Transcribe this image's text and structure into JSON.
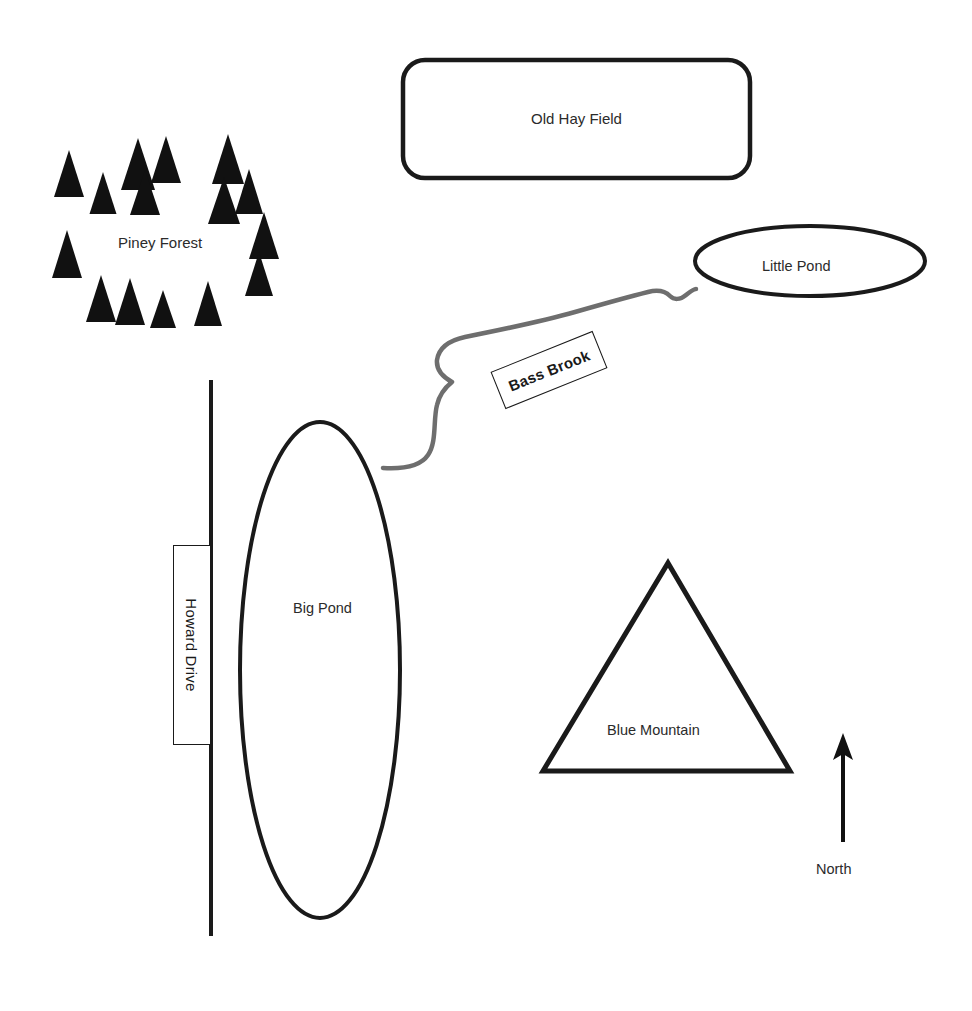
{
  "map": {
    "title": "Nature Area Sketch Map",
    "background_color": "#ffffff",
    "ink_color": "#1a1a1a",
    "text_color": "#2b2b2b",
    "brook_color": "#6e6e6e",
    "features": {
      "old_hay_field": {
        "label": "Old Hay Field",
        "shape": "rounded-rectangle",
        "x": 403,
        "y": 60,
        "width": 347,
        "height": 118
      },
      "piney_forest": {
        "label": "Piney Forest",
        "shape": "tree-cluster",
        "tree_count": 17,
        "tree_color": "#111111"
      },
      "little_pond": {
        "label": "Little Pond",
        "shape": "ellipse",
        "cx": 810,
        "cy": 261,
        "rx": 115,
        "ry": 35
      },
      "big_pond": {
        "label": "Big Pond",
        "shape": "ellipse",
        "cx": 320,
        "cy": 670,
        "rx": 80,
        "ry": 248
      },
      "bass_brook": {
        "label": "Bass Brook",
        "shape": "wavy-line",
        "rotation_deg": -22
      },
      "howard_drive": {
        "label": "Howard Drive",
        "shape": "vertical-line",
        "x": 211,
        "y_top": 380,
        "y_bottom": 936,
        "rotation_deg": 90
      },
      "blue_mountain": {
        "label": "Blue Mountain",
        "shape": "triangle",
        "apex_x": 668,
        "apex_y": 563,
        "base_left_x": 543,
        "base_right_x": 790,
        "base_y": 771
      },
      "north_arrow": {
        "label": "North",
        "shape": "arrow-up",
        "x": 843,
        "y_top": 733,
        "y_bottom": 842
      }
    },
    "trees": [
      {
        "cx": 69,
        "base": 197,
        "w": 30,
        "h": 47
      },
      {
        "cx": 103,
        "base": 214,
        "w": 27,
        "h": 42
      },
      {
        "cx": 138,
        "base": 190,
        "w": 34,
        "h": 52
      },
      {
        "cx": 145,
        "base": 215,
        "w": 30,
        "h": 45
      },
      {
        "cx": 166,
        "base": 183,
        "w": 30,
        "h": 47
      },
      {
        "cx": 228,
        "base": 184,
        "w": 32,
        "h": 50
      },
      {
        "cx": 224,
        "base": 224,
        "w": 32,
        "h": 47
      },
      {
        "cx": 249,
        "base": 214,
        "w": 28,
        "h": 45
      },
      {
        "cx": 264,
        "base": 259,
        "w": 30,
        "h": 47
      },
      {
        "cx": 67,
        "base": 278,
        "w": 30,
        "h": 48
      },
      {
        "cx": 101,
        "base": 322,
        "w": 30,
        "h": 47
      },
      {
        "cx": 130,
        "base": 325,
        "w": 30,
        "h": 47
      },
      {
        "cx": 163,
        "base": 328,
        "w": 26,
        "h": 38
      },
      {
        "cx": 208,
        "base": 326,
        "w": 28,
        "h": 45
      },
      {
        "cx": 259,
        "base": 296,
        "w": 28,
        "h": 44
      }
    ]
  }
}
